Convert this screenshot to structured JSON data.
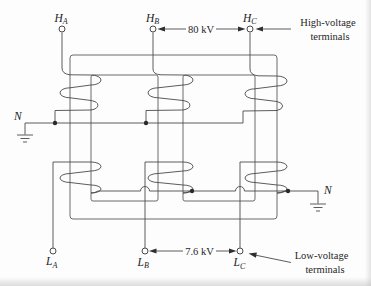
{
  "figure": {
    "background": "#fdfdfd",
    "line_color": "#4a4a4a",
    "text_color": "#1c1c1c",
    "hv_terminals": [
      {
        "main": "H",
        "sub": "A"
      },
      {
        "main": "H",
        "sub": "B"
      },
      {
        "main": "H",
        "sub": "C"
      }
    ],
    "lv_terminals": [
      {
        "main": "L",
        "sub": "A"
      },
      {
        "main": "L",
        "sub": "B"
      },
      {
        "main": "L",
        "sub": "C"
      }
    ],
    "neutral_left": "N",
    "neutral_right": "N",
    "hv_voltage": "80 kV",
    "lv_voltage": "7.6 kV",
    "hv_caption_line1": "High-voltage",
    "hv_caption_line2": "terminals",
    "lv_caption_line1": "Low-voltage",
    "lv_caption_line2": "terminals"
  }
}
